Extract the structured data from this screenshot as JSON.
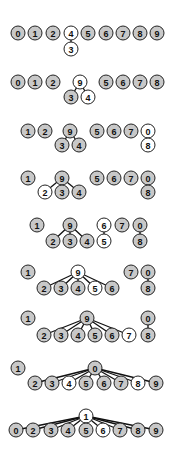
{
  "diagram": {
    "type": "union-find forest states",
    "colors": {
      "gray": "#c8c8c8",
      "white": "#ffffff",
      "stroke": "#222222"
    },
    "node_radius": 7,
    "steps": [
      {
        "nodes": [
          {
            "label": "0",
            "x": 18,
            "y": 33,
            "fill": "gray"
          },
          {
            "label": "1",
            "x": 35,
            "y": 33,
            "fill": "gray"
          },
          {
            "label": "2",
            "x": 53,
            "y": 33,
            "fill": "gray"
          },
          {
            "label": "4",
            "x": 71,
            "y": 33,
            "fill": "white"
          },
          {
            "label": "3",
            "x": 71,
            "y": 49,
            "fill": "white"
          },
          {
            "label": "5",
            "x": 88,
            "y": 33,
            "fill": "gray"
          },
          {
            "label": "6",
            "x": 106,
            "y": 33,
            "fill": "gray"
          },
          {
            "label": "7",
            "x": 123,
            "y": 33,
            "fill": "gray"
          },
          {
            "label": "8",
            "x": 140,
            "y": 33,
            "fill": "gray"
          },
          {
            "label": "9",
            "x": 157,
            "y": 33,
            "fill": "gray"
          }
        ],
        "edges": [
          [
            "4",
            "3"
          ]
        ]
      },
      {
        "nodes": [
          {
            "label": "0",
            "x": 18,
            "y": 82,
            "fill": "gray"
          },
          {
            "label": "1",
            "x": 35,
            "y": 82,
            "fill": "gray"
          },
          {
            "label": "2",
            "x": 53,
            "y": 82,
            "fill": "gray"
          },
          {
            "label": "9",
            "x": 80,
            "y": 82,
            "fill": "white"
          },
          {
            "label": "3",
            "x": 71,
            "y": 97,
            "fill": "gray"
          },
          {
            "label": "4",
            "x": 88,
            "y": 97,
            "fill": "white"
          },
          {
            "label": "5",
            "x": 106,
            "y": 82,
            "fill": "gray"
          },
          {
            "label": "6",
            "x": 123,
            "y": 82,
            "fill": "gray"
          },
          {
            "label": "7",
            "x": 140,
            "y": 82,
            "fill": "gray"
          },
          {
            "label": "8",
            "x": 157,
            "y": 82,
            "fill": "gray"
          }
        ],
        "edges": [
          [
            "9",
            "3"
          ],
          [
            "9",
            "4"
          ]
        ]
      },
      {
        "nodes": [
          {
            "label": "1",
            "x": 28,
            "y": 131,
            "fill": "gray"
          },
          {
            "label": "2",
            "x": 45,
            "y": 131,
            "fill": "gray"
          },
          {
            "label": "9",
            "x": 70,
            "y": 131,
            "fill": "gray"
          },
          {
            "label": "3",
            "x": 62,
            "y": 145,
            "fill": "gray"
          },
          {
            "label": "4",
            "x": 79,
            "y": 145,
            "fill": "gray"
          },
          {
            "label": "5",
            "x": 97,
            "y": 131,
            "fill": "gray"
          },
          {
            "label": "6",
            "x": 114,
            "y": 131,
            "fill": "gray"
          },
          {
            "label": "7",
            "x": 131,
            "y": 131,
            "fill": "gray"
          },
          {
            "label": "0",
            "x": 148,
            "y": 131,
            "fill": "white"
          },
          {
            "label": "8",
            "x": 148,
            "y": 145,
            "fill": "white"
          }
        ],
        "edges": [
          [
            "9",
            "3"
          ],
          [
            "9",
            "4"
          ],
          [
            "0",
            "8"
          ]
        ]
      },
      {
        "nodes": [
          {
            "label": "1",
            "x": 28,
            "y": 178,
            "fill": "gray"
          },
          {
            "label": "9",
            "x": 62,
            "y": 178,
            "fill": "gray"
          },
          {
            "label": "2",
            "x": 45,
            "y": 192,
            "fill": "white"
          },
          {
            "label": "3",
            "x": 62,
            "y": 192,
            "fill": "gray"
          },
          {
            "label": "4",
            "x": 79,
            "y": 192,
            "fill": "gray"
          },
          {
            "label": "5",
            "x": 97,
            "y": 178,
            "fill": "gray"
          },
          {
            "label": "6",
            "x": 114,
            "y": 178,
            "fill": "gray"
          },
          {
            "label": "7",
            "x": 131,
            "y": 178,
            "fill": "gray"
          },
          {
            "label": "0",
            "x": 148,
            "y": 178,
            "fill": "gray"
          },
          {
            "label": "8",
            "x": 148,
            "y": 192,
            "fill": "gray"
          }
        ],
        "edges": [
          [
            "9",
            "2"
          ],
          [
            "9",
            "3"
          ],
          [
            "9",
            "4"
          ],
          [
            "0",
            "8"
          ]
        ]
      },
      {
        "nodes": [
          {
            "label": "1",
            "x": 37,
            "y": 225,
            "fill": "gray"
          },
          {
            "label": "9",
            "x": 70,
            "y": 225,
            "fill": "gray"
          },
          {
            "label": "2",
            "x": 53,
            "y": 241,
            "fill": "gray"
          },
          {
            "label": "3",
            "x": 70,
            "y": 241,
            "fill": "gray"
          },
          {
            "label": "4",
            "x": 87,
            "y": 241,
            "fill": "gray"
          },
          {
            "label": "6",
            "x": 104,
            "y": 225,
            "fill": "white"
          },
          {
            "label": "5",
            "x": 104,
            "y": 241,
            "fill": "white"
          },
          {
            "label": "7",
            "x": 122,
            "y": 225,
            "fill": "gray"
          },
          {
            "label": "0",
            "x": 140,
            "y": 225,
            "fill": "gray"
          },
          {
            "label": "8",
            "x": 140,
            "y": 241,
            "fill": "gray"
          }
        ],
        "edges": [
          [
            "9",
            "2"
          ],
          [
            "9",
            "3"
          ],
          [
            "9",
            "4"
          ],
          [
            "6",
            "5"
          ],
          [
            "0",
            "8"
          ]
        ]
      },
      {
        "nodes": [
          {
            "label": "1",
            "x": 28,
            "y": 272,
            "fill": "gray"
          },
          {
            "label": "9",
            "x": 78,
            "y": 272,
            "fill": "white"
          },
          {
            "label": "2",
            "x": 44,
            "y": 288,
            "fill": "gray"
          },
          {
            "label": "3",
            "x": 61,
            "y": 288,
            "fill": "gray"
          },
          {
            "label": "4",
            "x": 78,
            "y": 288,
            "fill": "gray"
          },
          {
            "label": "5",
            "x": 95,
            "y": 288,
            "fill": "white"
          },
          {
            "label": "6",
            "x": 112,
            "y": 288,
            "fill": "gray"
          },
          {
            "label": "7",
            "x": 131,
            "y": 272,
            "fill": "gray"
          },
          {
            "label": "0",
            "x": 148,
            "y": 272,
            "fill": "gray"
          },
          {
            "label": "8",
            "x": 148,
            "y": 288,
            "fill": "gray"
          }
        ],
        "edges": [
          [
            "9",
            "2"
          ],
          [
            "9",
            "3"
          ],
          [
            "9",
            "4"
          ],
          [
            "9",
            "5"
          ],
          [
            "9",
            "6"
          ],
          [
            "0",
            "8"
          ]
        ]
      },
      {
        "nodes": [
          {
            "label": "1",
            "x": 28,
            "y": 318,
            "fill": "gray"
          },
          {
            "label": "9",
            "x": 87,
            "y": 318,
            "fill": "gray"
          },
          {
            "label": "2",
            "x": 44,
            "y": 335,
            "fill": "gray"
          },
          {
            "label": "3",
            "x": 61,
            "y": 335,
            "fill": "gray"
          },
          {
            "label": "4",
            "x": 78,
            "y": 335,
            "fill": "gray"
          },
          {
            "label": "5",
            "x": 95,
            "y": 335,
            "fill": "gray"
          },
          {
            "label": "6",
            "x": 112,
            "y": 335,
            "fill": "gray"
          },
          {
            "label": "7",
            "x": 129,
            "y": 335,
            "fill": "white"
          },
          {
            "label": "0",
            "x": 148,
            "y": 318,
            "fill": "gray"
          },
          {
            "label": "8",
            "x": 148,
            "y": 335,
            "fill": "gray"
          }
        ],
        "edges": [
          [
            "9",
            "2"
          ],
          [
            "9",
            "3"
          ],
          [
            "9",
            "4"
          ],
          [
            "9",
            "5"
          ],
          [
            "9",
            "6"
          ],
          [
            "9",
            "7"
          ],
          [
            "0",
            "8"
          ]
        ]
      },
      {
        "nodes": [
          {
            "label": "1",
            "x": 18,
            "y": 368,
            "fill": "gray"
          },
          {
            "label": "0",
            "x": 95,
            "y": 368,
            "fill": "gray"
          },
          {
            "label": "2",
            "x": 35,
            "y": 383,
            "fill": "gray"
          },
          {
            "label": "3",
            "x": 52,
            "y": 383,
            "fill": "gray"
          },
          {
            "label": "4",
            "x": 69,
            "y": 383,
            "fill": "white"
          },
          {
            "label": "5",
            "x": 86,
            "y": 383,
            "fill": "gray"
          },
          {
            "label": "6",
            "x": 104,
            "y": 383,
            "fill": "gray"
          },
          {
            "label": "7",
            "x": 121,
            "y": 383,
            "fill": "gray"
          },
          {
            "label": "8",
            "x": 138,
            "y": 383,
            "fill": "white"
          },
          {
            "label": "9",
            "x": 156,
            "y": 383,
            "fill": "gray"
          }
        ],
        "edges": [
          [
            "0",
            "2"
          ],
          [
            "0",
            "3"
          ],
          [
            "0",
            "4"
          ],
          [
            "0",
            "5"
          ],
          [
            "0",
            "6"
          ],
          [
            "0",
            "7"
          ],
          [
            "0",
            "8"
          ],
          [
            "0",
            "9"
          ]
        ]
      },
      {
        "nodes": [
          {
            "label": "1",
            "x": 86,
            "y": 416,
            "fill": "white"
          },
          {
            "label": "0",
            "x": 16,
            "y": 430,
            "fill": "gray"
          },
          {
            "label": "2",
            "x": 33,
            "y": 430,
            "fill": "gray"
          },
          {
            "label": "3",
            "x": 51,
            "y": 430,
            "fill": "gray"
          },
          {
            "label": "4",
            "x": 68,
            "y": 430,
            "fill": "gray"
          },
          {
            "label": "5",
            "x": 86,
            "y": 430,
            "fill": "gray"
          },
          {
            "label": "6",
            "x": 103,
            "y": 430,
            "fill": "white"
          },
          {
            "label": "7",
            "x": 120,
            "y": 430,
            "fill": "gray"
          },
          {
            "label": "8",
            "x": 138,
            "y": 430,
            "fill": "gray"
          },
          {
            "label": "9",
            "x": 156,
            "y": 430,
            "fill": "gray"
          }
        ],
        "edges": [
          [
            "1",
            "0"
          ],
          [
            "1",
            "2"
          ],
          [
            "1",
            "3"
          ],
          [
            "1",
            "4"
          ],
          [
            "1",
            "5"
          ],
          [
            "1",
            "6"
          ],
          [
            "1",
            "7"
          ],
          [
            "1",
            "8"
          ],
          [
            "1",
            "9"
          ]
        ]
      }
    ]
  }
}
